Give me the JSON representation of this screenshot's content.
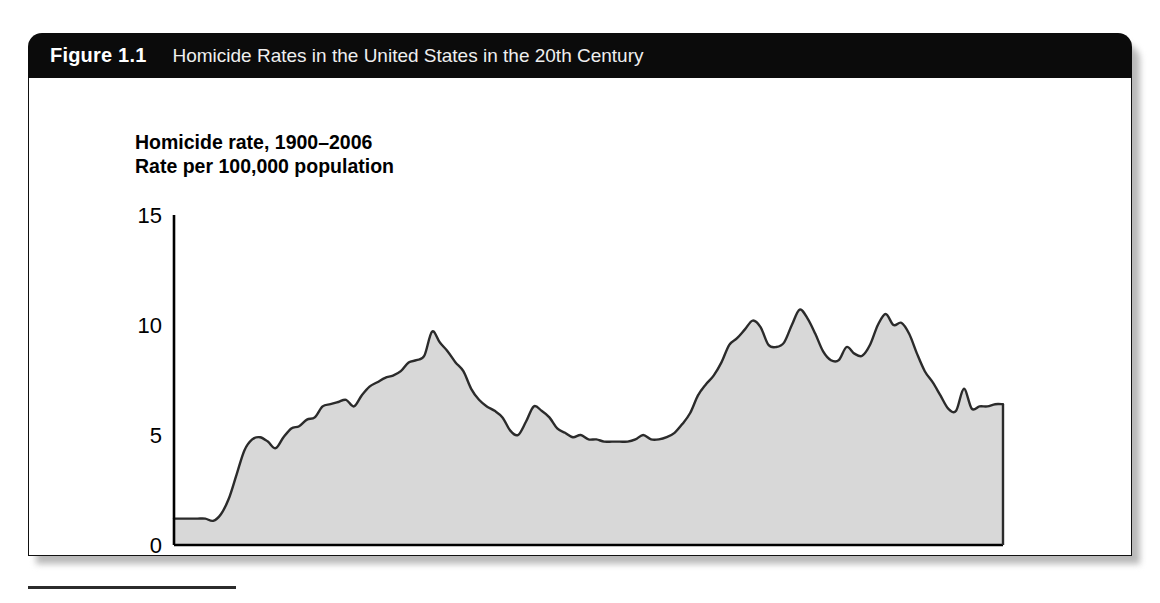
{
  "figure": {
    "number_label": "Figure 1.1",
    "caption": "Homicide Rates in the United States in the 20th Century"
  },
  "colors": {
    "header_bg": "#0b0b0b",
    "header_text": "#efefef",
    "area_fill": "#d8d8d8",
    "line_stroke": "#2b2b2b",
    "axis": "#000000",
    "page_bg": "#ffffff"
  },
  "chart_data": {
    "type": "area",
    "title": "Homicide rate, 1900–2006",
    "subtitle": "Rate per 100,000 population",
    "xlabel": "",
    "ylabel": "",
    "xlim": [
      1900,
      2006
    ],
    "ylim": [
      0,
      15
    ],
    "grid": false,
    "legend": "none",
    "xticks": [
      1900,
      1916,
      1932,
      1948,
      1964,
      1980,
      1996,
      2006
    ],
    "xtick_labels": [
      "1900",
      "1916",
      "1932",
      "1948",
      "1964",
      "1980",
      "1996",
      "2006"
    ],
    "yticks": [
      0,
      5,
      10,
      15
    ],
    "ytick_labels": [
      "0",
      "5",
      "10",
      "15"
    ],
    "series_name": "Homicide rate per 100,000 population",
    "x": [
      1900,
      1901,
      1902,
      1903,
      1904,
      1905,
      1906,
      1907,
      1908,
      1909,
      1910,
      1911,
      1912,
      1913,
      1914,
      1915,
      1916,
      1917,
      1918,
      1919,
      1920,
      1921,
      1922,
      1923,
      1924,
      1925,
      1926,
      1927,
      1928,
      1929,
      1930,
      1931,
      1932,
      1933,
      1934,
      1935,
      1936,
      1937,
      1938,
      1939,
      1940,
      1941,
      1942,
      1943,
      1944,
      1945,
      1946,
      1947,
      1948,
      1949,
      1950,
      1951,
      1952,
      1953,
      1954,
      1955,
      1956,
      1957,
      1958,
      1959,
      1960,
      1961,
      1962,
      1963,
      1964,
      1965,
      1966,
      1967,
      1968,
      1969,
      1970,
      1971,
      1972,
      1973,
      1974,
      1975,
      1976,
      1977,
      1978,
      1979,
      1980,
      1981,
      1982,
      1983,
      1984,
      1985,
      1986,
      1987,
      1988,
      1989,
      1990,
      1991,
      1992,
      1993,
      1994,
      1995,
      1996,
      1997,
      1998,
      1999,
      2000,
      2001,
      2002,
      2003,
      2004,
      2005,
      2006
    ],
    "y": [
      1.2,
      1.2,
      1.2,
      1.2,
      1.2,
      1.1,
      1.4,
      2.1,
      3.2,
      4.3,
      4.8,
      4.9,
      4.7,
      4.4,
      4.9,
      5.3,
      5.4,
      5.7,
      5.8,
      6.3,
      6.4,
      6.5,
      6.6,
      6.3,
      6.8,
      7.2,
      7.4,
      7.6,
      7.7,
      7.9,
      8.3,
      8.4,
      8.6,
      9.7,
      9.2,
      8.8,
      8.3,
      7.9,
      7.1,
      6.6,
      6.3,
      6.1,
      5.8,
      5.2,
      5.0,
      5.6,
      6.3,
      6.1,
      5.8,
      5.3,
      5.1,
      4.9,
      5.0,
      4.8,
      4.8,
      4.7,
      4.7,
      4.7,
      4.7,
      4.8,
      5.0,
      4.8,
      4.8,
      4.9,
      5.1,
      5.5,
      6.0,
      6.8,
      7.3,
      7.7,
      8.3,
      9.1,
      9.4,
      9.8,
      10.2,
      9.9,
      9.1,
      9.0,
      9.2,
      10.0,
      10.7,
      10.3,
      9.6,
      8.8,
      8.4,
      8.4,
      9.0,
      8.7,
      8.6,
      9.1,
      10.0,
      10.5,
      10.0,
      10.1,
      9.6,
      8.7,
      7.9,
      7.4,
      6.8,
      6.2,
      6.1,
      7.1,
      6.2,
      6.3,
      6.3,
      6.4,
      6.4
    ]
  },
  "footnote_rule": {
    "present": true
  }
}
